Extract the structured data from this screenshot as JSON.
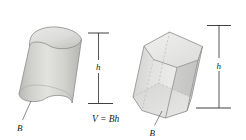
{
  "figure": {
    "background_color": "#ffffff",
    "caption_formula": "V = Bh",
    "left_solid": {
      "name": "oblique-cylinder",
      "height_label": "h",
      "base_label": "B",
      "fill_color": "#d4d4d2",
      "outline_color": "#8c8c8c"
    },
    "right_solid": {
      "name": "oblique-hexagonal-prism",
      "height_label": "h",
      "base_label": "B",
      "fill_color": "#d9dad8",
      "outline_color": "#8c8c8c"
    }
  }
}
